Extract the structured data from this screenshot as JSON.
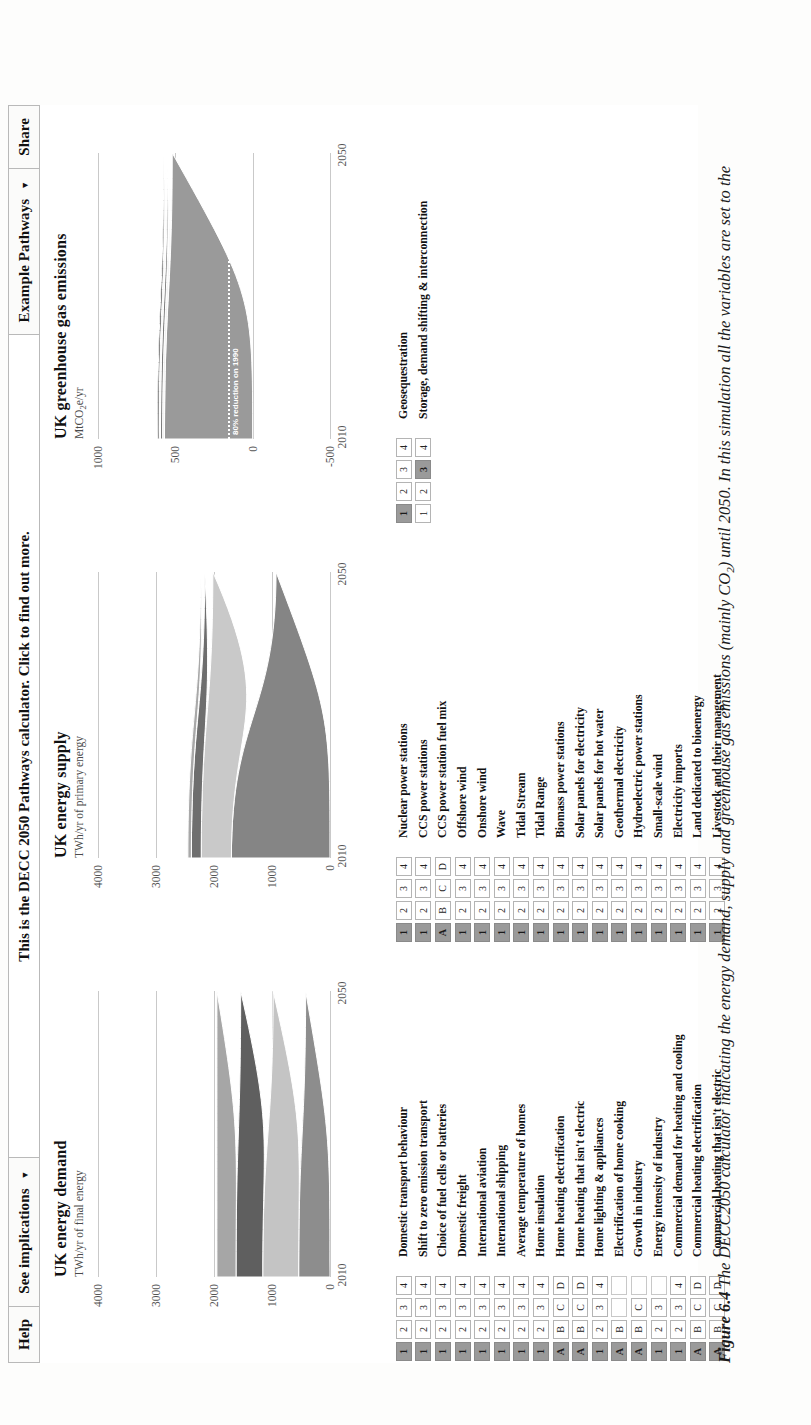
{
  "toolbar": {
    "help_label": "Help",
    "see_implications_label": "See implications",
    "see_implications_caret": "▼",
    "banner_text": "This is the DECC 2050 Pathways calculator. Click to find out more.",
    "example_pathways_label": "Example Pathways",
    "example_pathways_caret": "▼",
    "share_label": "Share"
  },
  "chart_data": [
    {
      "type": "area",
      "title": "UK energy demand",
      "subtitle_main": "TWh/yr of final energy",
      "sub_prefix": "TWh/yr of final energy",
      "ylabel": "TWh/yr of final energy",
      "xlabel": "",
      "ylim": [
        0,
        4000
      ],
      "yticks": [
        0,
        1000,
        2000,
        3000,
        4000
      ],
      "ytick_labels": [
        "0",
        "1000",
        "2000",
        "3000",
        "4000"
      ],
      "x": [
        2010,
        2050
      ],
      "xticks": [
        2010,
        2050
      ],
      "xtick_labels": [
        "2010",
        "2050"
      ],
      "grid": true,
      "legend": "none",
      "series": [
        {
          "name": "Transport",
          "color": "#8d8d8d",
          "values": [
            540,
            420
          ]
        },
        {
          "name": "Heating and cooling",
          "color": "#c4c4c4",
          "values": [
            620,
            560
          ]
        },
        {
          "name": "Lighting & appliances",
          "color": "#5f5f5f",
          "values": [
            460,
            560
          ]
        },
        {
          "name": "Industry",
          "color": "#a6a6a6",
          "values": [
            330,
            410
          ]
        }
      ],
      "totals": [
        1950,
        1950
      ]
    },
    {
      "type": "area",
      "title": "UK energy supply",
      "subtitle_main": "TWh/yr of primary energy",
      "ylabel": "TWh/yr of primary energy",
      "xlabel": "",
      "ylim": [
        0,
        4000
      ],
      "yticks": [
        0,
        1000,
        2000,
        3000,
        4000
      ],
      "ytick_labels": [
        "0",
        "1000",
        "2000",
        "3000",
        "4000"
      ],
      "x": [
        2010,
        2050
      ],
      "xticks": [
        2010,
        2050
      ],
      "xtick_labels": [
        "2010",
        "2050"
      ],
      "grid": true,
      "legend": "none",
      "series": [
        {
          "name": "Fossil fuels",
          "color": "#858585",
          "values": [
            1700,
            930
          ]
        },
        {
          "name": "Bioenergy",
          "color": "#c9c9c9",
          "values": [
            520,
            1090
          ]
        },
        {
          "name": "Nuclear",
          "color": "#6e6e6e",
          "values": [
            170,
            140
          ]
        },
        {
          "name": "Renewables",
          "color": "#a8a8a8",
          "values": [
            60,
            70
          ]
        }
      ],
      "totals": [
        2450,
        2230
      ]
    },
    {
      "type": "area",
      "title": "UK greenhouse gas emissions",
      "subtitle_main": "MtCO2e/yr",
      "subtitle_pre": "MtCO",
      "subtitle_sub": "2",
      "subtitle_post": "e/yr",
      "ylabel": "MtCO2e/yr",
      "xlabel": "",
      "ylim": [
        -500,
        1000
      ],
      "yticks": [
        -500,
        0,
        500,
        1000
      ],
      "ytick_labels": [
        "-500",
        "0",
        "500",
        "1000"
      ],
      "x": [
        2010,
        2050
      ],
      "xticks": [
        2010,
        2050
      ],
      "xtick_labels": [
        "2010",
        "2050"
      ],
      "grid": true,
      "legend": "none",
      "annotation": "80% reduction on 1990",
      "annotation_value": 160,
      "series": [
        {
          "name": "Emissions",
          "color": "#9a9a9a",
          "values": [
            570,
            520
          ]
        },
        {
          "name": "Transport",
          "color": "#efefef",
          "values": [
            12,
            14
          ]
        },
        {
          "name": "Industry",
          "color": "#7d7d7d",
          "values": [
            14,
            16
          ]
        },
        {
          "name": "Other",
          "color": "#f4f4f4",
          "values": [
            9,
            11
          ]
        },
        {
          "name": "Agriculture",
          "color": "#2a2a2a",
          "values": [
            9,
            14
          ]
        }
      ],
      "totals": [
        614,
        575
      ]
    }
  ],
  "levers": {
    "demand_column": [
      {
        "label": "Domestic transport behaviour",
        "options": [
          "1",
          "2",
          "3",
          "4"
        ],
        "selected": 0
      },
      {
        "label": "Shift to zero emission transport",
        "options": [
          "1",
          "2",
          "3",
          "4"
        ],
        "selected": 0
      },
      {
        "label": "Choice of fuel cells or batteries",
        "options": [
          "1",
          "2",
          "3",
          "4"
        ],
        "selected": 0
      },
      {
        "label": "Domestic freight",
        "options": [
          "1",
          "2",
          "3",
          "4"
        ],
        "selected": 0
      },
      {
        "label": "International aviation",
        "options": [
          "1",
          "2",
          "3",
          "4"
        ],
        "selected": 0
      },
      {
        "label": "International shipping",
        "options": [
          "1",
          "2",
          "3",
          "4"
        ],
        "selected": 0
      },
      {
        "label": "Average temperature of homes",
        "options": [
          "1",
          "2",
          "3",
          "4"
        ],
        "selected": 0
      },
      {
        "label": "Home insulation",
        "options": [
          "1",
          "2",
          "3",
          "4"
        ],
        "selected": 0
      },
      {
        "label": "Home heating electrification",
        "options": [
          "A",
          "B",
          "C",
          "D"
        ],
        "selected": 0
      },
      {
        "label": "Home heating that isn't electric",
        "options": [
          "A",
          "B",
          "C",
          "D"
        ],
        "selected": 0
      },
      {
        "label": "Home lighting & appliances",
        "options": [
          "1",
          "2",
          "3",
          "4"
        ],
        "selected": 0
      },
      {
        "label": "Electrification of home cooking",
        "options": [
          "A",
          "B",
          "",
          ""
        ],
        "selected": 0
      },
      {
        "label": "Growth in industry",
        "options": [
          "A",
          "B",
          "C",
          ""
        ],
        "selected": 0
      },
      {
        "label": "Energy intensity of industry",
        "options": [
          "1",
          "2",
          "3",
          ""
        ],
        "selected": 0
      },
      {
        "label": "Commercial demand for heating and cooling",
        "options": [
          "1",
          "2",
          "3",
          "4"
        ],
        "selected": 0
      },
      {
        "label": "Commercial heating electrification",
        "options": [
          "A",
          "B",
          "C",
          "D"
        ],
        "selected": 0
      },
      {
        "label": "Commercial heating that isn't electric",
        "options": [
          "A",
          "B",
          "C",
          "D"
        ],
        "selected": 0
      }
    ],
    "supply_column": [
      {
        "label": "Nuclear power stations",
        "options": [
          "1",
          "2",
          "3",
          "4"
        ],
        "selected": 0
      },
      {
        "label": "CCS power stations",
        "options": [
          "1",
          "2",
          "3",
          "4"
        ],
        "selected": 0
      },
      {
        "label": "CCS power station fuel mix",
        "options": [
          "A",
          "B",
          "C",
          "D"
        ],
        "selected": 0
      },
      {
        "label": "Offshore wind",
        "options": [
          "1",
          "2",
          "3",
          "4"
        ],
        "selected": 0
      },
      {
        "label": "Onshore wind",
        "options": [
          "1",
          "2",
          "3",
          "4"
        ],
        "selected": 0
      },
      {
        "label": "Wave",
        "options": [
          "1",
          "2",
          "3",
          "4"
        ],
        "selected": 0
      },
      {
        "label": "Tidal Stream",
        "options": [
          "1",
          "2",
          "3",
          "4"
        ],
        "selected": 0
      },
      {
        "label": "Tidal Range",
        "options": [
          "1",
          "2",
          "3",
          "4"
        ],
        "selected": 0
      },
      {
        "label": "Biomass power stations",
        "options": [
          "1",
          "2",
          "3",
          "4"
        ],
        "selected": 0
      },
      {
        "label": "Solar panels for electricity",
        "options": [
          "1",
          "2",
          "3",
          "4"
        ],
        "selected": 0
      },
      {
        "label": "Solar panels for hot water",
        "options": [
          "1",
          "2",
          "3",
          "4"
        ],
        "selected": 0
      },
      {
        "label": "Geothermal electricity",
        "options": [
          "1",
          "2",
          "3",
          "4"
        ],
        "selected": 0
      },
      {
        "label": "Hydroelectric power stations",
        "options": [
          "1",
          "2",
          "3",
          "4"
        ],
        "selected": 0
      },
      {
        "label": "Small-scale wind",
        "options": [
          "1",
          "2",
          "3",
          "4"
        ],
        "selected": 0
      },
      {
        "label": "Electricity imports",
        "options": [
          "1",
          "2",
          "3",
          "4"
        ],
        "selected": 0
      },
      {
        "label": "Land dedicated to bioenergy",
        "options": [
          "1",
          "2",
          "3",
          "4"
        ],
        "selected": 0
      },
      {
        "label": "Livestock and their management",
        "options": [
          "1",
          "2",
          "3",
          "4"
        ],
        "selected": 0
      }
    ],
    "storage_column": [
      {
        "label": "Geosequestration",
        "options": [
          "1",
          "2",
          "3",
          "4"
        ],
        "selected": 0
      },
      {
        "label": "Storage, demand shifting & interconnection",
        "options": [
          "1",
          "2",
          "3",
          "4"
        ],
        "selected": 2
      }
    ]
  },
  "caption": {
    "number": "Figure 6.4",
    "text_pre": "The DECC2050 calculator indicating the energy demand, supply and greenhouse gas emissions (mainly CO",
    "text_sub": "2",
    "text_post": ") until 2050. In this simulation all the variables are set to the"
  },
  "colors": {
    "selected_button": "#9a9a9a",
    "unselected_button": "#ffffff",
    "button_border": "#b4b4b4",
    "grid": "#c9c9c9",
    "text": "#111111"
  }
}
